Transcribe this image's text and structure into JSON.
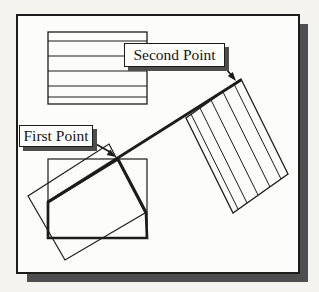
{
  "figure": {
    "colors": {
      "background": "#f4f3f0",
      "panel": "#fcfcfb",
      "line": "#1c1c1a",
      "shadow": "#4e4e4e"
    },
    "callouts": [
      {
        "id": "first-point",
        "label": "First Point",
        "box": {
          "left": 19,
          "top": 125,
          "width": 74,
          "height": 22
        }
      },
      {
        "id": "second-point",
        "label": "Second Point",
        "box": {
          "left": 124,
          "top": 43,
          "width": 101,
          "height": 24
        }
      }
    ],
    "shapes": [
      {
        "name": "panel-shadow",
        "type": "rect",
        "x": 27,
        "y": 24,
        "w": 281,
        "h": 258,
        "fill": "shadow"
      },
      {
        "name": "panel",
        "type": "rect",
        "x": 17,
        "y": 15,
        "w": 282,
        "h": 258,
        "fill": "panel",
        "stroke": 2
      },
      {
        "name": "striped-rectangle",
        "type": "rect",
        "x": 48,
        "y": 32,
        "w": 99,
        "h": 72,
        "stroke": 1.3
      },
      {
        "name": "stripe-line",
        "type": "line",
        "x1": 48,
        "y1": 41,
        "x2": 147,
        "y2": 41,
        "stroke": 1
      },
      {
        "name": "stripe-line",
        "type": "line",
        "x1": 48,
        "y1": 56,
        "x2": 147,
        "y2": 56,
        "stroke": 1
      },
      {
        "name": "stripe-line",
        "type": "line",
        "x1": 48,
        "y1": 71,
        "x2": 147,
        "y2": 71,
        "stroke": 1
      },
      {
        "name": "stripe-line",
        "type": "line",
        "x1": 48,
        "y1": 86,
        "x2": 147,
        "y2": 86,
        "stroke": 1
      },
      {
        "name": "stripe-line",
        "type": "line",
        "x1": 48,
        "y1": 97,
        "x2": 147,
        "y2": 97,
        "stroke": 1
      },
      {
        "name": "rotated-striped-rectangle",
        "type": "polygon",
        "points": [
          [
            241,
            79
          ],
          [
            288,
            174
          ],
          [
            233,
            213
          ],
          [
            186,
            118
          ]
        ],
        "stroke": 1.3
      },
      {
        "name": "rotated-stripe-line",
        "type": "line",
        "x1": 234,
        "y1": 84,
        "x2": 281,
        "y2": 179,
        "stroke": 1
      },
      {
        "name": "rotated-stripe-line",
        "type": "line",
        "x1": 223,
        "y1": 92,
        "x2": 270,
        "y2": 187,
        "stroke": 1
      },
      {
        "name": "rotated-stripe-line",
        "type": "line",
        "x1": 211,
        "y1": 100,
        "x2": 258,
        "y2": 195,
        "stroke": 1
      },
      {
        "name": "rotated-stripe-line",
        "type": "line",
        "x1": 200,
        "y1": 108,
        "x2": 247,
        "y2": 203,
        "stroke": 1
      },
      {
        "name": "rotated-stripe-line",
        "type": "line",
        "x1": 191,
        "y1": 114,
        "x2": 238,
        "y2": 209,
        "stroke": 1
      },
      {
        "name": "original-rectangle",
        "type": "rect",
        "x": 48,
        "y": 159,
        "w": 99,
        "h": 79,
        "stroke": 1.2
      },
      {
        "name": "tilted-outline-rectangle",
        "type": "polygon",
        "points": [
          [
            109,
            144
          ],
          [
            145,
            213
          ],
          [
            65,
            260
          ],
          [
            28,
            196
          ]
        ],
        "stroke": 1.2
      },
      {
        "name": "result-outline",
        "type": "polygon",
        "points": [
          [
            48,
            202
          ],
          [
            118,
            159
          ],
          [
            146,
            212
          ],
          [
            147,
            238
          ],
          [
            48,
            238
          ]
        ],
        "stroke": 2.7
      },
      {
        "name": "rotation-line",
        "type": "line",
        "x1": 48,
        "y1": 202,
        "x2": 241,
        "y2": 80,
        "stroke": 2.7
      },
      {
        "name": "leader-line-first-point",
        "type": "line",
        "x1": 94,
        "y1": 143,
        "x2": 110,
        "y2": 152,
        "stroke": 1.7
      },
      {
        "name": "leader-arrowhead-first-point",
        "type": "polygon",
        "points": [
          [
            116,
            157
          ],
          [
            106.7,
            154.9
          ],
          [
            110.1,
            149.5
          ]
        ],
        "fill": "line"
      },
      {
        "name": "leader-line-second-point",
        "type": "line",
        "x1": 222,
        "y1": 64,
        "x2": 232,
        "y2": 76,
        "stroke": 1.7
      },
      {
        "name": "leader-arrowhead-second-point",
        "type": "polygon",
        "points": [
          [
            236,
            81
          ],
          [
            227.8,
            76
          ],
          [
            232.8,
            71.9
          ]
        ],
        "fill": "line"
      }
    ]
  }
}
